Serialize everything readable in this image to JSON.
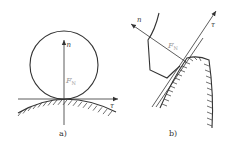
{
  "figure": {
    "panel_a": {
      "caption": "a)",
      "normal_label": "n",
      "tangent_label": "τ",
      "force_label": "F",
      "force_subscript": "N",
      "description": "Circle resting on convex hatched surface; normal n vertical, tangent τ horizontal"
    },
    "panel_b": {
      "caption": "b)",
      "normal_label": "n",
      "tangent_label": "τ",
      "force_label": "F",
      "force_subscript": "N",
      "description": "Gear tooth contact; normal n inclined up-left, tangent τ inclined up-right"
    },
    "colors": {
      "line": "#333333",
      "label_gray": "#9a9a9a",
      "background": "#ffffff"
    }
  }
}
